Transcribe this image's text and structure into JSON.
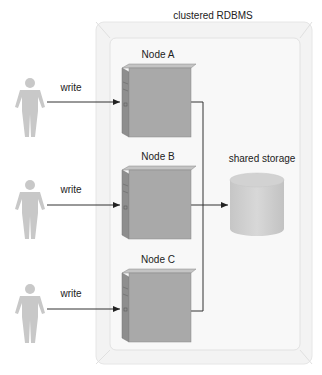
{
  "diagram": {
    "container": {
      "label": "clustered RDBMS"
    },
    "nodes": [
      {
        "id": "A",
        "label": "Node A"
      },
      {
        "id": "B",
        "label": "Node B"
      },
      {
        "id": "C",
        "label": "Node C"
      }
    ],
    "storage": {
      "label": "shared storage"
    },
    "clients": [
      {
        "edge_label": "write",
        "target": "Node A"
      },
      {
        "edge_label": "write",
        "target": "Node B"
      },
      {
        "edge_label": "write",
        "target": "Node C"
      }
    ],
    "colors": {
      "server_front": "#a9a9a9",
      "server_side": "#8c8c8c",
      "server_top": "#c4c4c4",
      "storage": "#d0d0d0",
      "person": "#c8c8c8",
      "container_fill": "#f6f6f6",
      "line": "#333333"
    }
  }
}
